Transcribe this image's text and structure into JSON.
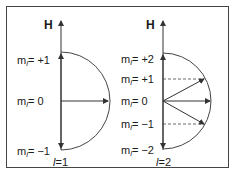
{
  "figure": {
    "frame_color": "#444444",
    "line_color": "#333333",
    "panels": [
      {
        "id": "l1",
        "axis_label": "H",
        "quantum_label_prefix": "l",
        "quantum_label_value": "=1",
        "ml_labels": [
          {
            "prefix": "m",
            "sub": "l",
            "value": "= +1"
          },
          {
            "prefix": "m",
            "sub": "l",
            "value": "= 0"
          },
          {
            "prefix": "m",
            "sub": "l",
            "value": "= −1"
          }
        ]
      },
      {
        "id": "l2",
        "axis_label": "H",
        "quantum_label_prefix": "l",
        "quantum_label_value": "=2",
        "ml_labels": [
          {
            "prefix": "m",
            "sub": "l",
            "value": "= +2"
          },
          {
            "prefix": "m",
            "sub": "l",
            "value": "= +1"
          },
          {
            "prefix": "m",
            "sub": "l",
            "value": "= 0"
          },
          {
            "prefix": "m",
            "sub": "l",
            "value": "= −1"
          },
          {
            "prefix": "m",
            "sub": "l",
            "value": "= −2"
          }
        ]
      }
    ]
  }
}
